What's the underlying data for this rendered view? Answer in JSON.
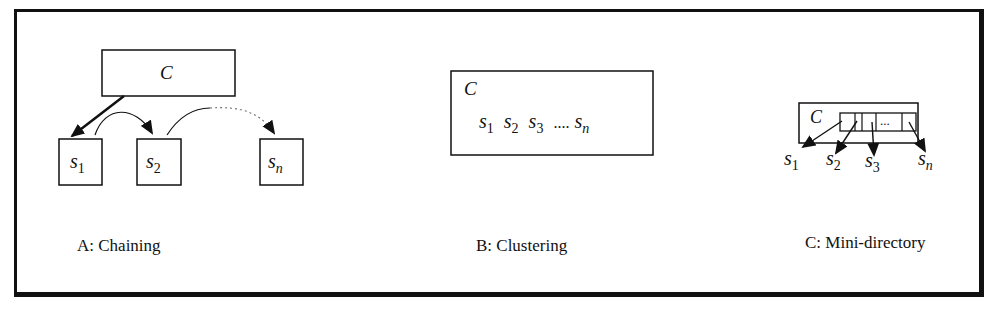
{
  "panels": [
    {
      "id": "A",
      "caption": "A: Chaining",
      "container": "C",
      "items": [
        "S1",
        "S2",
        "Sn"
      ]
    },
    {
      "id": "B",
      "caption": "B: Clustering",
      "container": "C",
      "items": [
        "S1",
        "S2",
        "S3",
        "....",
        "Sn"
      ]
    },
    {
      "id": "C",
      "caption": "C: Mini-directory",
      "container": "C",
      "items": [
        "S1",
        "S2",
        "S3",
        "Sn"
      ],
      "directory_slots": [
        "",
        "",
        "",
        "...",
        ""
      ]
    }
  ],
  "labels": {
    "c": "C",
    "s": "s",
    "sub1": "1",
    "sub2": "2",
    "sub3": "3",
    "subn": "n",
    "dots4": "....",
    "dots3": "..."
  }
}
